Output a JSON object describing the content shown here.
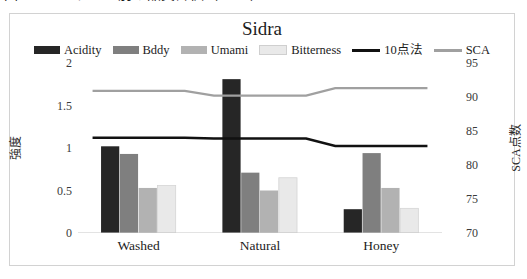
{
  "caption": {
    "text": "図 11-13  ステージ別の品質評価（Sidra）"
  },
  "chart_data": {
    "type": "bar",
    "title": "Sidra",
    "categories": [
      "Washed",
      "Natural",
      "Honey"
    ],
    "series": [
      {
        "name": "Acidity",
        "kind": "bar",
        "axis": "left",
        "color": "#262626",
        "values": [
          1.02,
          1.81,
          0.28
        ]
      },
      {
        "name": "Bddy",
        "kind": "bar",
        "axis": "left",
        "color": "#7f7f7f",
        "values": [
          0.93,
          0.71,
          0.94
        ]
      },
      {
        "name": "Umami",
        "kind": "bar",
        "axis": "left",
        "color": "#b2b2b2",
        "values": [
          0.53,
          0.5,
          0.53
        ]
      },
      {
        "name": "Bitterness",
        "kind": "bar",
        "axis": "left",
        "color": "#e9e9e9",
        "values": [
          0.56,
          0.65,
          0.29
        ]
      },
      {
        "name": "10点法",
        "kind": "line",
        "axis": "right",
        "color": "#111111",
        "values": [
          84.0,
          83.9,
          82.8
        ]
      },
      {
        "name": "SCA",
        "kind": "line",
        "axis": "right",
        "color": "#a0a0a0",
        "values": [
          90.9,
          90.2,
          91.3
        ]
      }
    ],
    "xlabel": "",
    "ylabel": "強度",
    "y2label": "SCA点数",
    "ylim": [
      0,
      2
    ],
    "yticks": [
      "0",
      "0.5",
      "1",
      "1.5",
      "2"
    ],
    "y2lim": [
      70,
      95
    ],
    "y2ticks": [
      "70",
      "75",
      "80",
      "85",
      "90",
      "95"
    ],
    "grid": false,
    "legend_position": "top"
  }
}
